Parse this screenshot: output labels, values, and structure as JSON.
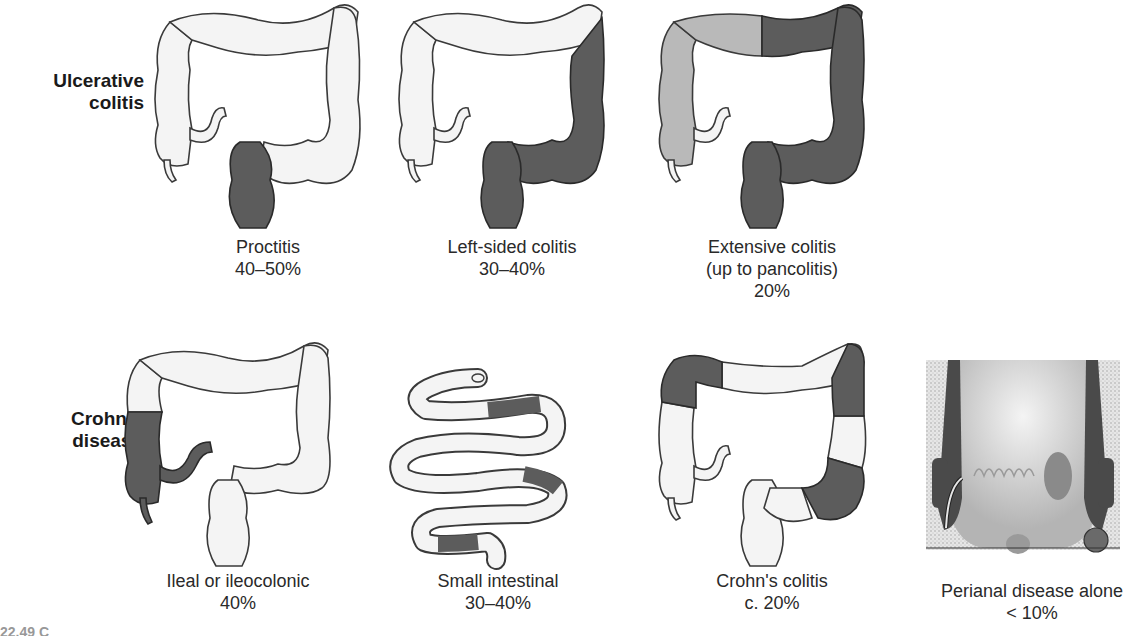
{
  "colors": {
    "normal": "#f4f4f4",
    "outline": "#3a3a3a",
    "diseased_dark": "#5c5c5c",
    "diseased_light": "#b9b9b9",
    "background": "#ffffff"
  },
  "rows": [
    {
      "label_line1": "Ulcerative",
      "label_line2": "colitis",
      "panels": [
        {
          "name": "proctitis",
          "title_line1": "Proctitis",
          "title_line2": "",
          "percent": "40–50%"
        },
        {
          "name": "left-sided-colitis",
          "title_line1": "Left-sided colitis",
          "title_line2": "",
          "percent": "30–40%"
        },
        {
          "name": "extensive-colitis",
          "title_line1": "Extensive colitis",
          "title_line2": "(up to pancolitis)",
          "percent": "20%"
        }
      ]
    },
    {
      "label_line1": "Crohn's",
      "label_line2": "disease",
      "panels": [
        {
          "name": "ileal-ileocolonic",
          "title_line1": "Ileal or ileocolonic",
          "title_line2": "",
          "percent": "40%"
        },
        {
          "name": "small-intestinal",
          "title_line1": "Small intestinal",
          "title_line2": "",
          "percent": "30–40%"
        },
        {
          "name": "crohns-colitis",
          "title_line1": "Crohn's colitis",
          "title_line2": "",
          "percent": "c. 20%"
        },
        {
          "name": "perianal-disease",
          "title_line1": "Perianal disease alone",
          "title_line2": "",
          "percent": "< 10%"
        }
      ]
    }
  ],
  "figure_caption_fragment": "22.49 C"
}
